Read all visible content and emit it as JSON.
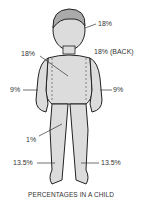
{
  "diagram": {
    "title": "PERCENTAGES IN A CHILD",
    "labels": {
      "head_front": "18%",
      "back": "18% (BACK)",
      "trunk_front": "18%",
      "left_arm": "9%",
      "right_arm": "9%",
      "genitals": "1%",
      "left_leg": "13.5%",
      "right_leg": "13.5%"
    },
    "colors": {
      "skin": "#d9d9d9",
      "outline": "#222222",
      "text": "#333333"
    }
  }
}
